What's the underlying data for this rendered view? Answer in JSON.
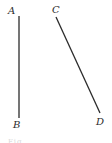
{
  "figure": {
    "segments": [
      {
        "name": "AB",
        "from": {
          "label": "A",
          "x": 19,
          "y": 16
        },
        "to": {
          "label": "B",
          "x": 19,
          "y": 118
        }
      },
      {
        "name": "CD",
        "from": {
          "label": "C",
          "x": 56,
          "y": 17
        },
        "to": {
          "label": "D",
          "x": 100,
          "y": 113
        }
      }
    ],
    "labels": {
      "a": "A",
      "b": "B",
      "c": "C",
      "d": "D"
    },
    "caption": "Fig. …",
    "stroke_color": "#2b2b2b"
  }
}
